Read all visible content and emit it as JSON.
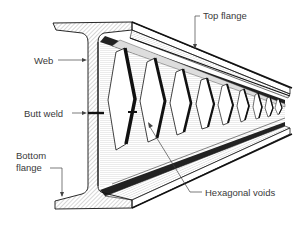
{
  "diagram": {
    "labels": {
      "top_flange": "Top flange",
      "web": "Web",
      "butt_weld": "Butt weld",
      "bottom_flange_line1": "Bottom",
      "bottom_flange_line2": "flange",
      "hexagonal_voids": "Hexagonal voids"
    },
    "colors": {
      "ink": "#111111",
      "hatch": "#555555",
      "label_text": "#3a3a3a",
      "leader": "#444444",
      "background": "#ffffff"
    }
  }
}
